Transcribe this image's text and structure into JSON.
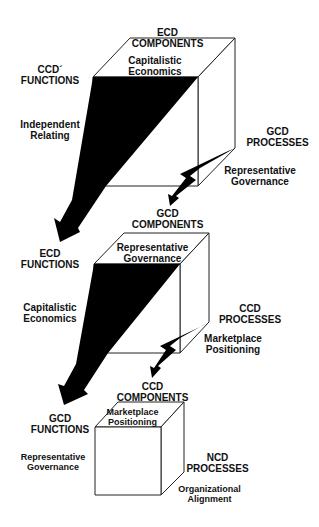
{
  "cubes": [
    {
      "components": {
        "line1": "ECD",
        "line2": "COMPONENTS"
      },
      "top_face": {
        "line1": "Capitalistic",
        "line2": "Economics"
      },
      "functions": {
        "line1": "CCD´",
        "line2": "FUNCTIONS"
      },
      "functions_value": {
        "line1": "Independent",
        "line2": "Relating"
      },
      "processes": {
        "line1": "GCD",
        "line2": "PROCESSES"
      },
      "processes_value": {
        "line1": "Representative",
        "line2": "Governance"
      }
    },
    {
      "components": {
        "line1": "GCD",
        "line2": "COMPONENTS"
      },
      "top_face": {
        "line1": "Representative",
        "line2": "Governance"
      },
      "functions": {
        "line1": "ECD",
        "line2": "FUNCTIONS"
      },
      "functions_value": {
        "line1": "Capitalistic",
        "line2": "Economics"
      },
      "processes": {
        "line1": "CCD",
        "line2": "PROCESSES"
      },
      "processes_value": {
        "line1": "Marketplace",
        "line2": "Positioning"
      }
    },
    {
      "components": {
        "line1": "CCD",
        "line2": "COMPONENTS"
      },
      "top_face": {
        "line1": "Marketplace",
        "line2": "Positioning"
      },
      "functions": {
        "line1": "GCD",
        "line2": "FUNCTIONS"
      },
      "functions_value": {
        "line1": "Representative",
        "line2": "Governance"
      },
      "processes": {
        "line1": "NCD",
        "line2": "PROCESSES"
      },
      "processes_value": {
        "line1": "Organizational",
        "line2": "Alignment"
      }
    }
  ],
  "colors": {
    "line": "#222222",
    "fill": "#000000",
    "background": "#ffffff"
  }
}
